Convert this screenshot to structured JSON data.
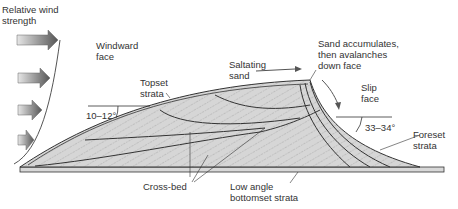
{
  "diagram": {
    "labels": {
      "wind_strength": "Relative wind\nstrength",
      "windward": "Windward\nface",
      "topset": "Topset\nstrata",
      "angle_windward": "10–12°",
      "saltating": "Saltating\nsand",
      "accumulates": "Sand accumulates,\nthen avalanches\ndown face",
      "slip": "Slip\nface",
      "angle_slip": "33–34°",
      "foreset": "Foreset\nstrata",
      "crossbed": "Cross-bed",
      "bottomset": "Low angle\nbottomset strata"
    },
    "colors": {
      "sand_fill": "#d4d4d4",
      "outline": "#333333",
      "arrow_dark": "#555555",
      "arrow_light": "#dddddd"
    },
    "wind_arrows": 4
  }
}
